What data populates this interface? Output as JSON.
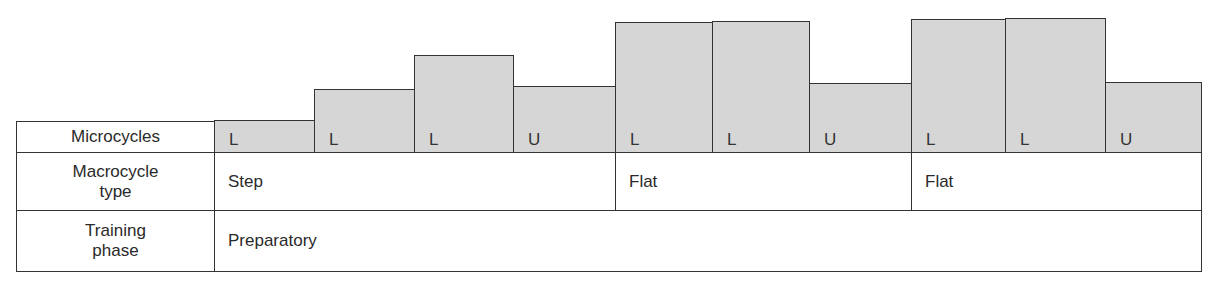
{
  "rows": {
    "microcycles": {
      "label": "Microcycles"
    },
    "macrocycle": {
      "label_line1": "Macrocycle",
      "label_line2": "type"
    },
    "training": {
      "label_line1": "Training",
      "label_line2": "phase"
    }
  },
  "microcycles": [
    {
      "label": "L",
      "x": 214,
      "w": 100,
      "top": 120
    },
    {
      "label": "L",
      "x": 314,
      "w": 100,
      "top": 89
    },
    {
      "label": "L",
      "x": 414,
      "w": 99,
      "top": 55
    },
    {
      "label": "U",
      "x": 513,
      "w": 102,
      "top": 86
    },
    {
      "label": "L",
      "x": 615,
      "w": 97,
      "top": 22
    },
    {
      "label": "L",
      "x": 712,
      "w": 97,
      "top": 21
    },
    {
      "label": "U",
      "x": 809,
      "w": 102,
      "top": 83
    },
    {
      "label": "L",
      "x": 911,
      "w": 94,
      "top": 19
    },
    {
      "label": "L",
      "x": 1005,
      "w": 100,
      "top": 18
    },
    {
      "label": "U",
      "x": 1105,
      "w": 96,
      "top": 82
    }
  ],
  "macrocycles": [
    {
      "label": "Step",
      "x": 214,
      "w": 401
    },
    {
      "label": "Flat",
      "x": 615,
      "w": 296
    },
    {
      "label": "Flat",
      "x": 911,
      "w": 290
    }
  ],
  "training_phase": {
    "label": "Preparatory"
  },
  "colors": {
    "bar_fill": "#d6d6d6",
    "border": "#333333"
  }
}
